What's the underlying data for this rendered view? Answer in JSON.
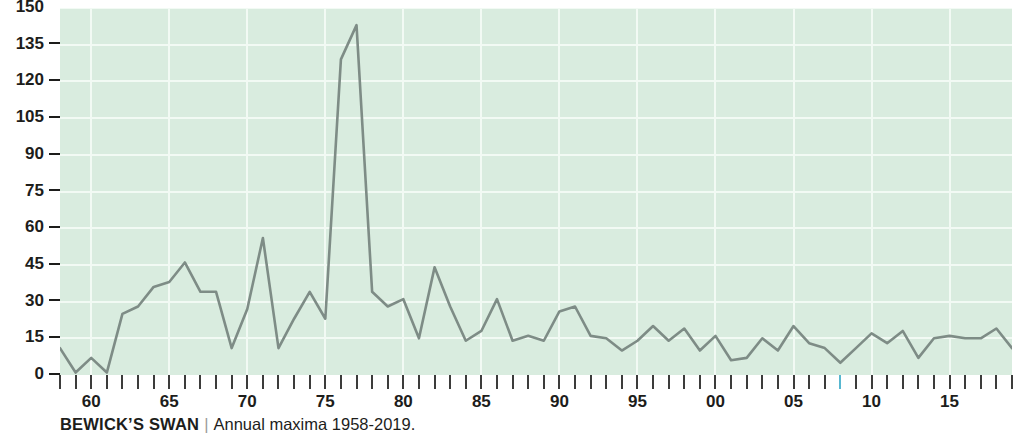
{
  "caption": {
    "species": "BEWICK’S SWAN",
    "separator": "|",
    "subtitle": "Annual maxima 1958-2019."
  },
  "chart_data": {
    "type": "line",
    "title": "BEWICK’S SWAN",
    "subtitle": "Annual maxima 1958-2019.",
    "xlabel": "",
    "ylabel": "",
    "ylim": [
      0,
      150
    ],
    "xlim": [
      1958,
      2019
    ],
    "yticks": [
      0,
      15,
      30,
      45,
      60,
      75,
      90,
      105,
      120,
      135,
      150
    ],
    "ytick_labels": [
      "0",
      "15",
      "30",
      "45",
      "60",
      "75",
      "90",
      "105",
      "120",
      "135",
      "150"
    ],
    "xticks": [
      1960,
      1965,
      1970,
      1975,
      1980,
      1985,
      1990,
      1995,
      2000,
      2005,
      2010,
      2015
    ],
    "xtick_labels": [
      "60",
      "65",
      "70",
      "75",
      "80",
      "85",
      "90",
      "95",
      "00",
      "05",
      "10",
      "15"
    ],
    "grid": true,
    "grid_color": "#f2faf4",
    "plot_background": "#d9ecdf",
    "line_color": "#7e8c86",
    "line_width": 2.6,
    "legend": null,
    "highlighted_xtick": 2008,
    "highlight_color": "#57b7d0",
    "x": [
      1958,
      1959,
      1960,
      1961,
      1962,
      1963,
      1964,
      1965,
      1966,
      1967,
      1968,
      1969,
      1970,
      1971,
      1972,
      1973,
      1974,
      1975,
      1976,
      1977,
      1978,
      1979,
      1980,
      1981,
      1982,
      1983,
      1984,
      1985,
      1986,
      1987,
      1988,
      1989,
      1990,
      1991,
      1992,
      1993,
      1994,
      1995,
      1996,
      1997,
      1998,
      1999,
      2000,
      2001,
      2002,
      2003,
      2004,
      2005,
      2006,
      2007,
      2008,
      2009,
      2010,
      2011,
      2012,
      2013,
      2014,
      2015,
      2016,
      2017,
      2018,
      2019
    ],
    "values": [
      11,
      1,
      7,
      1,
      25,
      28,
      36,
      38,
      46,
      34,
      34,
      11,
      27,
      56,
      11,
      23,
      34,
      23,
      129,
      143,
      34,
      28,
      31,
      15,
      44,
      28,
      14,
      18,
      31,
      14,
      16,
      14,
      26,
      28,
      16,
      15,
      10,
      14,
      20,
      14,
      19,
      10,
      16,
      6,
      7,
      15,
      10,
      20,
      13,
      11,
      5,
      11,
      17,
      13,
      18,
      7,
      15,
      16,
      15,
      15,
      19,
      11
    ],
    "series": [
      {
        "name": "Annual maxima",
        "values": [
          11,
          1,
          7,
          1,
          25,
          28,
          36,
          38,
          46,
          34,
          34,
          11,
          27,
          56,
          11,
          23,
          34,
          23,
          129,
          143,
          34,
          28,
          31,
          15,
          44,
          28,
          14,
          18,
          31,
          14,
          16,
          14,
          26,
          28,
          16,
          15,
          10,
          14,
          20,
          14,
          19,
          10,
          16,
          6,
          7,
          15,
          10,
          20,
          13,
          11,
          5,
          11,
          17,
          13,
          18,
          7,
          15,
          16,
          15,
          15,
          19,
          11
        ]
      }
    ]
  }
}
